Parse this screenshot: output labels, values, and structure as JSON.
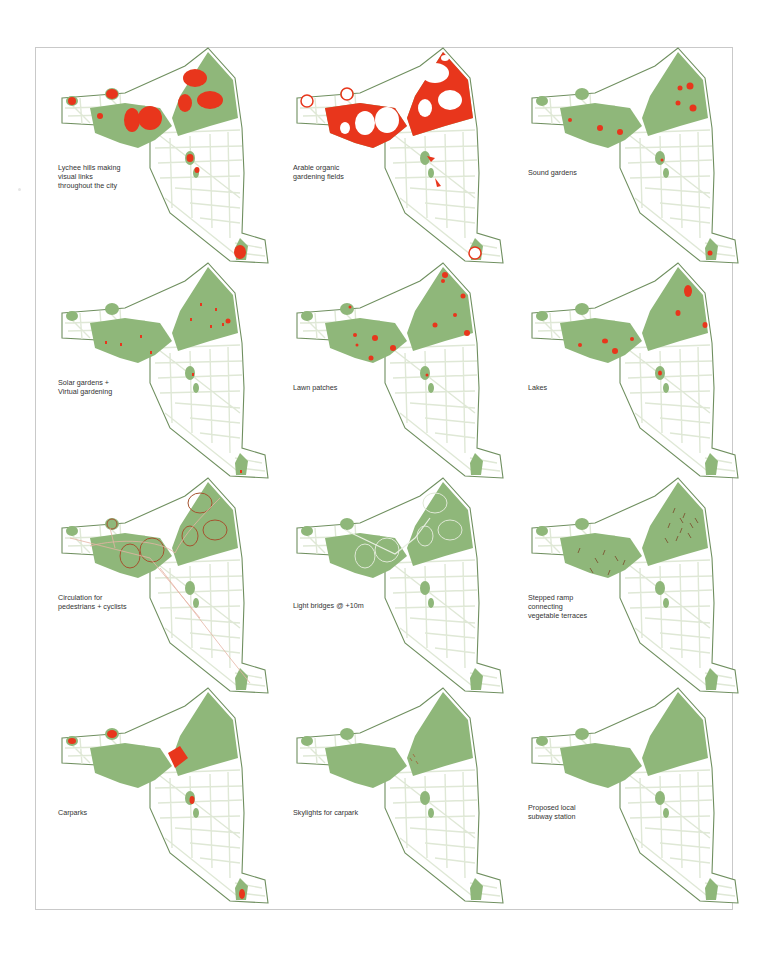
{
  "colors": {
    "map_outline": "#6f8f5f",
    "park_green": "#8fb77a",
    "street_lines": "#dfe8d6",
    "highlight_red": "#e8361c",
    "circulation_brown": "#a5532f",
    "frame_border": "#c9c9c9"
  },
  "panels": [
    {
      "id": "lychee-hills",
      "label": "Lychee hills making\nvisual links\nthroughout the city",
      "layer": "lychee"
    },
    {
      "id": "arable-fields",
      "label": "Arable organic\ngardening fields",
      "layer": "arable"
    },
    {
      "id": "sound-gardens",
      "label": "Sound gardens",
      "layer": "sound"
    },
    {
      "id": "solar-gardens",
      "label": "Solar gardens +\nVirtual gardening",
      "layer": "solar"
    },
    {
      "id": "lawn-patches",
      "label": "Lawn patches",
      "layer": "lawn"
    },
    {
      "id": "lakes",
      "label": "Lakes",
      "layer": "lakes"
    },
    {
      "id": "circulation",
      "label": "Circulation for\npedestrians + cyclists",
      "layer": "circulation"
    },
    {
      "id": "light-bridges",
      "label": "Light bridges @ +10m",
      "layer": "bridges"
    },
    {
      "id": "stepped-ramp",
      "label": "Stepped ramp\nconnecting\nvegetable terraces",
      "layer": "ramp"
    },
    {
      "id": "carparks",
      "label": "Carparks",
      "layer": "carparks"
    },
    {
      "id": "skylights",
      "label": "Skylights for carpark",
      "layer": "skylights"
    },
    {
      "id": "subway-station",
      "label": "Proposed local\nsubway station",
      "layer": "subway"
    }
  ]
}
